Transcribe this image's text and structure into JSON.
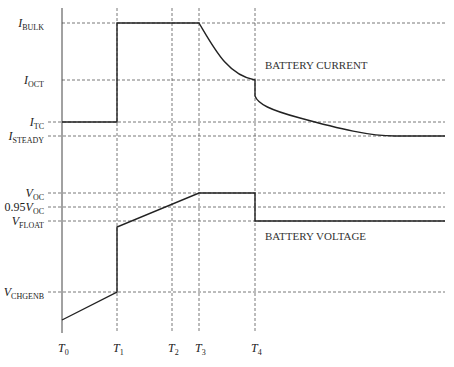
{
  "diagram": {
    "current_levels": [
      {
        "key": "I_BULK",
        "main": "I",
        "sub": "BULK"
      },
      {
        "key": "I_OCT",
        "main": "I",
        "sub": "OCT"
      },
      {
        "key": "I_TC",
        "main": "I",
        "sub": "TC"
      },
      {
        "key": "I_STEADY",
        "main": "I",
        "sub": "STEADY"
      }
    ],
    "voltage_levels": [
      {
        "key": "V_OC",
        "prefix": "",
        "main": "V",
        "sub": "OC"
      },
      {
        "key": "0.95V_OC",
        "prefix": "0.95",
        "main": "V",
        "sub": "OC"
      },
      {
        "key": "V_FLOAT",
        "prefix": "",
        "main": "V",
        "sub": "FLOAT"
      },
      {
        "key": "V_CHGENB",
        "prefix": "",
        "main": "V",
        "sub": "CHGENB"
      }
    ],
    "time_markers": [
      {
        "main": "T",
        "sub": "0"
      },
      {
        "main": "T",
        "sub": "1"
      },
      {
        "main": "T",
        "sub": "2"
      },
      {
        "main": "T",
        "sub": "3"
      },
      {
        "main": "T",
        "sub": "4"
      }
    ],
    "captions": {
      "current": "BATTERY CURRENT",
      "voltage": "BATTERY VOLTAGE"
    }
  }
}
